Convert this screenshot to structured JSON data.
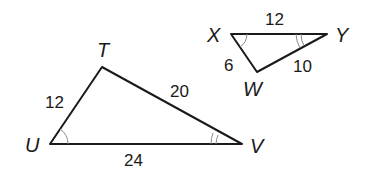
{
  "diagram": {
    "triangle_tuv": {
      "vertices": {
        "T": {
          "label": "T",
          "x": 102,
          "y": 67
        },
        "U": {
          "label": "U",
          "x": 50,
          "y": 144
        },
        "V": {
          "label": "V",
          "x": 242,
          "y": 144
        }
      },
      "sides": {
        "TU": "12",
        "TV": "20",
        "UV": "24"
      },
      "angle_marks": {
        "U": "single-arc",
        "V": "double-arc"
      }
    },
    "triangle_xyw": {
      "vertices": {
        "X": {
          "label": "X",
          "x": 231,
          "y": 34
        },
        "Y": {
          "label": "Y",
          "x": 327,
          "y": 34
        },
        "W": {
          "label": "W",
          "x": 257,
          "y": 72
        }
      },
      "sides": {
        "XY": "12",
        "XW": "6",
        "WY": "10"
      },
      "angle_marks": {
        "X": "single-arc",
        "Y": "double-arc"
      }
    },
    "colors": {
      "line": "#1a1a1a",
      "arc": "#8a8a8a",
      "background": "#ffffff"
    }
  }
}
